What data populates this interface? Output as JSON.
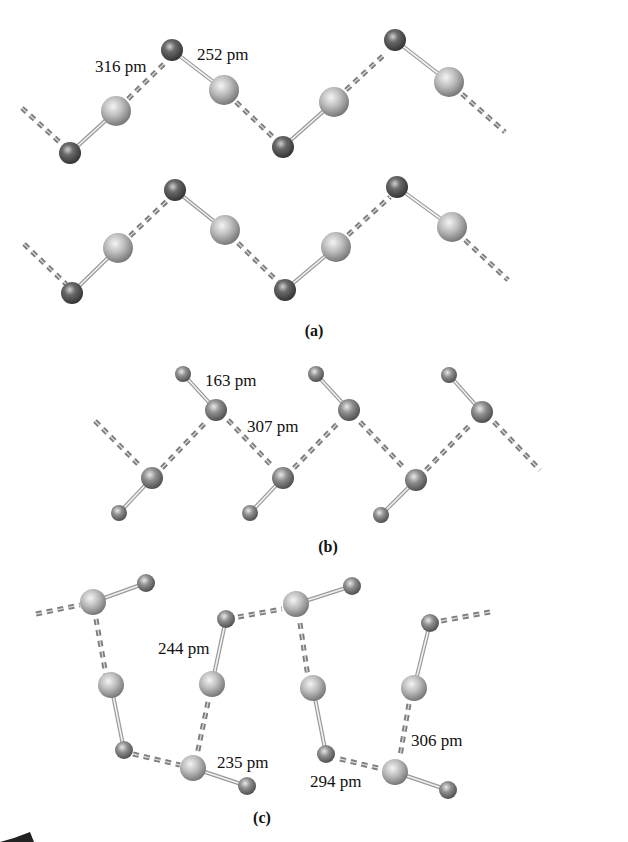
{
  "figure": {
    "panels": [
      {
        "id": "a",
        "caption": "(a)",
        "labels": [
          {
            "text": "316 pm",
            "x": 95,
            "y": 72
          },
          {
            "text": "252 pm",
            "x": 197,
            "y": 60
          }
        ],
        "description": "Two parallel zigzag chains of diatomic molecules (small dark atom bonded to large light atom) linked by dashed intermolecular contacts"
      },
      {
        "id": "b",
        "caption": "(b)",
        "labels": [
          {
            "text": "163 pm",
            "x": 205,
            "y": 386
          },
          {
            "text": "307 pm",
            "x": 247,
            "y": 432
          }
        ],
        "description": "Zigzag chain of diatomic molecules with short covalent bonds and longer dashed contacts"
      },
      {
        "id": "c",
        "caption": "(c)",
        "labels": [
          {
            "text": "244 pm",
            "x": 188,
            "y": 654
          },
          {
            "text": "235 pm",
            "x": 250,
            "y": 768
          },
          {
            "text": "294 pm",
            "x": 392,
            "y": 786
          },
          {
            "text": "306 pm",
            "x": 495,
            "y": 746
          }
        ],
        "description": "Ribbon/ladder network of diatomic molecules connected by dashed secondary interactions"
      }
    ],
    "legend_colors": {
      "large_atom": "#b8b8b8",
      "small_atom": "#5a5a5a",
      "bond": "#9a9a9a",
      "contact": "#7d7d7d"
    }
  }
}
